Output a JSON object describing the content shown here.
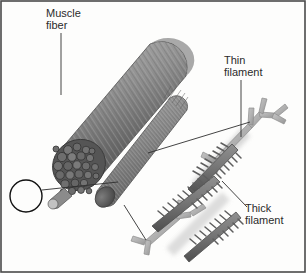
{
  "figure": {
    "background_color": "#fdfdfc",
    "border_color": "#4a4a4a",
    "width": 306,
    "height": 273
  },
  "labels": {
    "muscle_fiber": {
      "line1": "Muscle",
      "line2": "fiber"
    },
    "thin_filament": {
      "line1": "Thin",
      "line2": "filament"
    },
    "thick_filament": {
      "line1": "Thick",
      "line2": "filament"
    }
  },
  "structures": {
    "muscle_fiber": {
      "name": "muscle-fiber-cylinder",
      "description": "Large striated cylinder angled down-left with bundled myofibril cross-section at its lower-left end",
      "fill_light": "#a8a8a8",
      "fill_mid": "#8a8a8a",
      "fill_dark": "#5e5e5e",
      "striation_color": "#6b6b6b"
    },
    "cross_section": {
      "name": "myofibril-cross-section",
      "description": "Packed circles representing cut ends of myofibrils",
      "fill": "#585858",
      "circle_stroke": "#3a3a3a",
      "circle_count": 26
    },
    "callout_circle": {
      "name": "magnification-callout-circle",
      "description": "Black circle outline around a single myofibril at the fiber tip",
      "stroke": "#111111",
      "cx": 26,
      "cy": 196,
      "r": 16
    },
    "myofibril": {
      "name": "myofibril-cylinder",
      "description": "Thinner striated cylinder, magnified view of a single myofibril",
      "fill_light": "#9e9e9e",
      "fill_dark": "#5a5a5a",
      "striation_color": "#6f6f6f"
    },
    "thin_filament": {
      "name": "thin-filament",
      "description": "Light gray Y-branched forked rods",
      "fill": "#b4b4b4",
      "stroke": "#8d8d8d",
      "branch_count": 4
    },
    "thick_filament": {
      "name": "thick-filament",
      "description": "Dark gray rods with projecting myosin head spikes",
      "fill": "#7a7a7a",
      "stroke": "#4d4d4d",
      "spike_color": "#6a6a6a",
      "rod_count": 2
    }
  },
  "leader_lines": {
    "muscle_fiber": {
      "name": "leader-line-muscle-fiber",
      "from": [
        61,
        33
      ],
      "to": [
        61,
        95
      ]
    },
    "callout_to_myofibril": {
      "name": "leader-line-callout-to-myofibril",
      "from": [
        42,
        190
      ],
      "to": [
        118,
        182
      ]
    },
    "myofibril_to_filaments": {
      "name": "leader-line-myofibril-to-filaments",
      "from": [
        148,
        153
      ],
      "to": [
        250,
        122
      ]
    },
    "myofibril_bottom": {
      "name": "leader-line-myofibril-to-thin-filament",
      "from": [
        124,
        205
      ],
      "to": [
        146,
        240
      ]
    },
    "thin_filament": {
      "name": "leader-line-thin-filament",
      "from": [
        241,
        80
      ],
      "to": [
        241,
        137
      ]
    },
    "thick_filament": {
      "name": "leader-line-thick-filament",
      "from": [
        222,
        181
      ],
      "to": [
        247,
        207
      ]
    }
  }
}
